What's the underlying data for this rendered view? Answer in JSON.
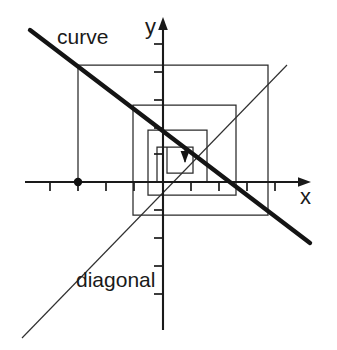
{
  "figure": {
    "background_color": "#ffffff",
    "ink_color": "#1a1a1a",
    "width": 337,
    "height": 350
  },
  "labels": {
    "curve": "curve",
    "diagonal": "diagonal",
    "axis_x": "x",
    "axis_y": "y"
  },
  "chart_data": {
    "type": "line",
    "title": "",
    "subtitle": "",
    "xlabel": "x",
    "ylabel": "y",
    "grid": false,
    "legend_position": "inline-annotations",
    "origin_px": [
      163,
      182
    ],
    "unit_px": 28,
    "xlim": [
      -4.9,
      5.3
    ],
    "ylim": [
      -5.3,
      5.9
    ],
    "axes": {
      "x_axis": {
        "label": "x",
        "start_px": [
          25,
          182
        ],
        "end_px": [
          310,
          182
        ],
        "arrow": "right",
        "ticks_px": [
          50,
          78,
          106,
          134,
          191,
          219,
          247,
          275
        ],
        "tick_length_px": 9
      },
      "y_axis": {
        "label": "y",
        "start_px": [
          163,
          330
        ],
        "end_px": [
          163,
          18
        ],
        "arrow": "up",
        "ticks_px": [
          44,
          72,
          100,
          128,
          154,
          210,
          238,
          266,
          294
        ],
        "tick_length_px": 9
      }
    },
    "series": [
      {
        "name": "curve",
        "kind": "function",
        "description": "decreasing straight map with slope -1",
        "slope": -1,
        "intercept": 0,
        "style": "thick",
        "points_px": [
          [
            30,
            30
          ],
          [
            310,
            243
          ]
        ]
      },
      {
        "name": "diagonal",
        "kind": "identity",
        "description": "line y = x",
        "slope": 1,
        "intercept": 0,
        "style": "thin",
        "points_px": [
          [
            22,
            338
          ],
          [
            287,
            65
          ]
        ]
      },
      {
        "name": "cobweb",
        "kind": "staircase",
        "description": "nested rectangles spiralling inward to the fixed point at the origin",
        "style": "thin",
        "vertices_px": [
          [
            78,
            182
          ],
          [
            78,
            65
          ],
          [
            268,
            65
          ],
          [
            268,
            215
          ],
          [
            133,
            215
          ],
          [
            133,
            105
          ],
          [
            236,
            105
          ],
          [
            236,
            195
          ],
          [
            148,
            195
          ],
          [
            148,
            130
          ],
          [
            207,
            130
          ],
          [
            207,
            182
          ],
          [
            157,
            182
          ],
          [
            157,
            147
          ],
          [
            193,
            147
          ],
          [
            193,
            173
          ],
          [
            167,
            173
          ],
          [
            167,
            147
          ],
          [
            185,
            147
          ],
          [
            185,
            162
          ]
        ]
      }
    ],
    "markers": [
      {
        "name": "initial-point",
        "description": "starting value on the x axis",
        "position_px": [
          78,
          182
        ],
        "radius_px": 4.2
      }
    ],
    "annotations": [
      {
        "name": "convergence-arrow",
        "description": "small arrow head pointing toward the fixed point",
        "position_px": [
          185,
          158
        ],
        "direction": "down"
      },
      {
        "name": "curve-label",
        "text": "curve",
        "position_px": [
          57,
          26
        ]
      },
      {
        "name": "diagonal-label",
        "text": "diagonal",
        "position_px": [
          76,
          269
        ]
      }
    ]
  }
}
